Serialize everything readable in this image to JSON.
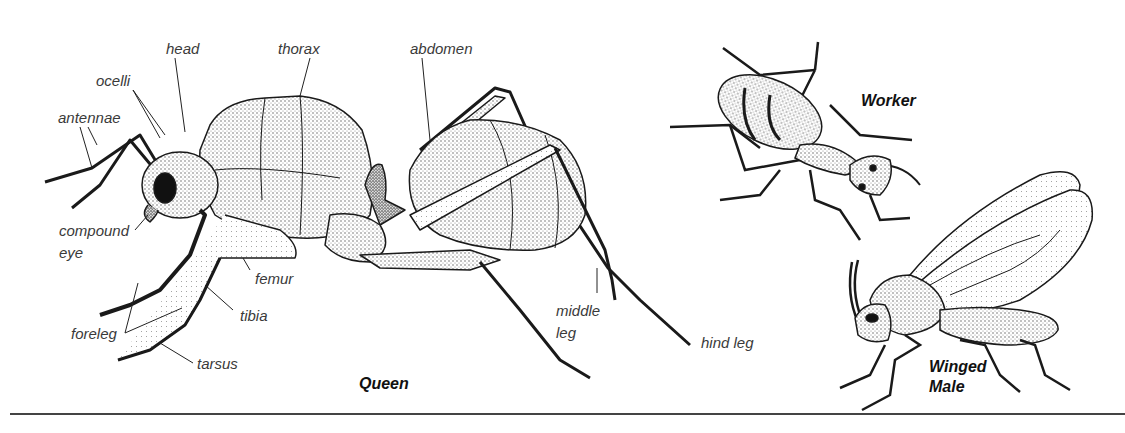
{
  "figure": {
    "subjects": [
      {
        "id": "queen",
        "title": "Queen"
      },
      {
        "id": "worker",
        "title": "Worker"
      },
      {
        "id": "winged_male",
        "title_line1": "Winged",
        "title_line2": "Male"
      }
    ],
    "labels": {
      "head": "head",
      "thorax": "thorax",
      "abdomen": "abdomen",
      "ocelli": "ocelli",
      "antennae": "antennae",
      "compound_eye_line1": "compound",
      "compound_eye_line2": "eye",
      "femur": "femur",
      "tibia": "tibia",
      "foreleg": "foreleg",
      "tarsus": "tarsus",
      "middle_leg_line1": "middle",
      "middle_leg_line2": "leg",
      "hind_leg": "hind leg"
    },
    "colors": {
      "ink": "#1a1a1a",
      "label_text": "#3a3a3a",
      "stipple": "#777777",
      "background": "#ffffff",
      "rule": "#444444"
    }
  }
}
